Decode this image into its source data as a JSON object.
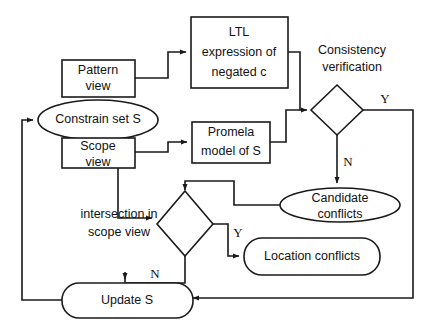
{
  "diagram": {
    "colors": {
      "stroke": "#1a1a1a",
      "fill": "#ffffff",
      "text": "#111111"
    },
    "nodes": {
      "pattern_view": {
        "line1": "Pattern",
        "line2": "view"
      },
      "constrain_set": {
        "label": "Constrain set S"
      },
      "scope_view": {
        "line1": "Scope",
        "line2": "view"
      },
      "ltl_expression": {
        "line1": "LTL",
        "line2": "expression of",
        "line3": "negated c"
      },
      "promela_model": {
        "line1": "Promela",
        "line2": "model of S"
      },
      "consistency_verification": {
        "line1": "Consistency",
        "line2": "verification"
      },
      "candidate_conflicts": {
        "line1": "Candidate",
        "line2": "conflicts"
      },
      "intersection_decision": {
        "line1": "intersection in",
        "line2": "scope view"
      },
      "location_conflicts": {
        "label": "Location conflicts"
      },
      "update_s": {
        "label": "Update S"
      }
    },
    "edge_labels": {
      "consistency_yes": "Y",
      "consistency_no": "N",
      "intersection_yes": "Y",
      "intersection_no": "N"
    }
  }
}
